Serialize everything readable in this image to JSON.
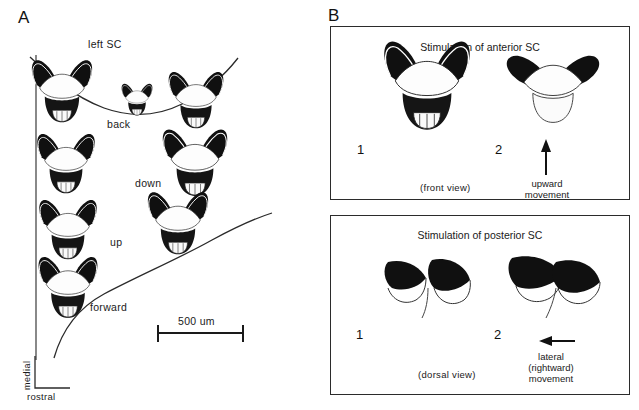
{
  "figure": {
    "panels": [
      {
        "letter": "A",
        "title": "left SC",
        "axis": {
          "vertical_label": "medial",
          "horizontal_label": "rostral"
        },
        "scale_bar": {
          "label": "500 um"
        },
        "movement_labels": [
          {
            "key": "back",
            "label": "back"
          },
          {
            "key": "down",
            "label": "down"
          },
          {
            "key": "up",
            "label": "up"
          },
          {
            "key": "forward",
            "label": "forward"
          }
        ]
      },
      {
        "letter": "B",
        "boxes": [
          {
            "title": "Stimulation of anterior SC",
            "frame_numbers": [
              "1",
              "2"
            ],
            "view": "(front view)",
            "movement": {
              "line1": "upward",
              "line2": "movement",
              "arrow": "up-arrow-icon"
            }
          },
          {
            "title": "Stimulation of posterior SC",
            "frame_numbers": [
              "1",
              "2"
            ],
            "view": "(dorsal view)",
            "movement": {
              "line1": "lateral",
              "line2": "(rightward)",
              "line3": "movement",
              "arrow": "left-arrow-icon"
            }
          }
        ]
      }
    ],
    "colors": {
      "ink": "#111111",
      "line": "#2b2b2b",
      "background": "#ffffff"
    }
  }
}
